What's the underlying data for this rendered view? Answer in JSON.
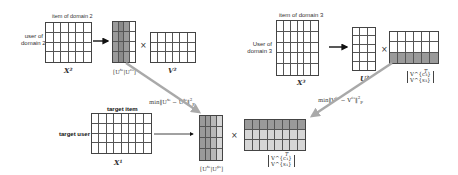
{
  "diagram": {
    "domain2": {
      "item_label": "item of domain 2",
      "user_label_line1": "user of",
      "user_label_line2": "domain 2",
      "matrix_label": "X²",
      "u_label": "[U^{s₁}|U^{c₂}]",
      "v_label": "V²",
      "times": "×",
      "x_grid": {
        "cols": 6,
        "rows": 4
      },
      "u_grid": {
        "cols": 4,
        "rows": 4,
        "shaded_cols": 3
      },
      "v_grid": {
        "cols": 6,
        "rows": 3
      }
    },
    "domain3": {
      "item_label": "item of domain 3",
      "user_label_line1": "User of",
      "user_label_line2": "domain 3",
      "matrix_label": "X³",
      "u_label": "U³",
      "v_label_top": "V^{c₃}",
      "v_label_bottom": "V^{s₃}",
      "v_label_sup": "T",
      "times": "×",
      "x_grid": {
        "cols": 6,
        "rows": 5
      },
      "u_grid": {
        "cols": 3,
        "rows": 5
      },
      "v_grid": {
        "cols": 6,
        "rows": 3,
        "shaded_rows": 1
      }
    },
    "target": {
      "item_label": "target item",
      "user_label": "target user",
      "matrix_label": "X¹",
      "u_label": "[U^{s₁}|U^{p₁}]",
      "v_label_top": "V^{c₁}",
      "v_label_bottom": "V^{s₁}",
      "v_label_sup": "T",
      "times": "×",
      "x_grid": {
        "cols": 8,
        "rows": 4
      },
      "u_grid": {
        "cols": 4,
        "rows": 4
      },
      "v_grid": {
        "cols": 8,
        "rows": 3
      }
    },
    "constraints": {
      "user_constraint": "min‖U^{s₁} − U^{s₂}‖²_F",
      "item_constraint": "min‖V^{c₁} − V^{c₃}‖²_F"
    },
    "colors": {
      "grid_line": "#555555",
      "shade_dark": "#9a9a9a",
      "shade_light": "#d6d6d6",
      "arrow_gray": "#a9a9a9"
    }
  }
}
